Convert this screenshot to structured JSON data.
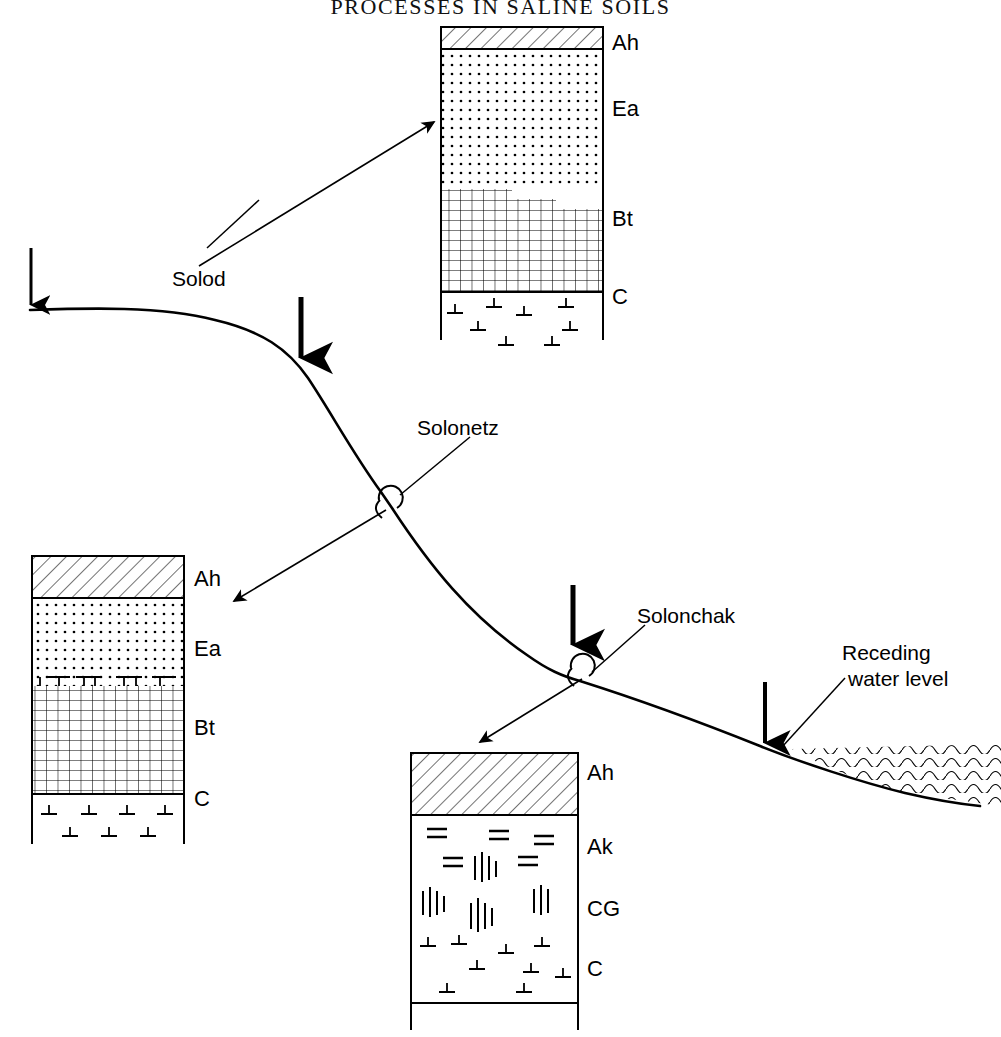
{
  "figure": {
    "title": "PROCESSES IN SALINE SOILS",
    "title_clipped": true,
    "type": "landscape-catena-diagram",
    "background": "#ffffff",
    "ink_color": "#000000"
  },
  "landscape": {
    "labels": [
      {
        "id": "solod",
        "text": "Solod",
        "x": 172,
        "y": 268
      },
      {
        "id": "solonetz",
        "text": "Solonetz",
        "x": 417,
        "y": 417
      },
      {
        "id": "solonchak",
        "text": "Solonchak",
        "x": 637,
        "y": 605
      }
    ],
    "water": {
      "label_line1": "Receding",
      "label_line2": "water level",
      "label_x": 843,
      "label_y": 641
    },
    "arrow_count": 4,
    "arrows": [
      {
        "id": "infiltration-arrow-1",
        "x": 31,
        "y1": 248,
        "y2": 310,
        "width": 3
      },
      {
        "id": "infiltration-arrow-2",
        "x": 301,
        "y1": 297,
        "y2": 363,
        "width": 5
      },
      {
        "id": "infiltration-arrow-3",
        "x": 573,
        "y1": 585,
        "y2": 650,
        "width": 5
      },
      {
        "id": "infiltration-arrow-4",
        "x": 765,
        "y1": 682,
        "y2": 748,
        "width": 4
      }
    ]
  },
  "profiles": [
    {
      "id": "solod-profile",
      "name": "Solod",
      "box": {
        "x": 441,
        "y": 27,
        "w": 162,
        "h": 265
      },
      "horizons": [
        {
          "code": "Ah",
          "pattern": "diagonal-hatch",
          "y": 27,
          "h": 22,
          "label_y": 32
        },
        {
          "code": "Ea",
          "pattern": "dot-stipple",
          "y": 49,
          "h": 140,
          "label_y": 97
        },
        {
          "code": "Bt",
          "pattern": "cross-grid",
          "y": 189,
          "h": 103,
          "label_y": 207
        },
        {
          "code": "C",
          "pattern": "perpendicular-symbols",
          "y": 292,
          "h": 48,
          "label_y": 285
        }
      ]
    },
    {
      "id": "solonetz-profile",
      "name": "Solonetz",
      "box": {
        "x": 32,
        "y": 556,
        "w": 152,
        "h": 238
      },
      "horizons": [
        {
          "code": "Ah",
          "pattern": "diagonal-hatch",
          "y": 556,
          "h": 42,
          "label_y": 567
        },
        {
          "code": "Ea",
          "pattern": "dot-stipple",
          "y": 598,
          "h": 88,
          "label_y": 637
        },
        {
          "code": "Bt",
          "pattern": "cross-grid",
          "y": 686,
          "h": 108,
          "label_y": 716
        },
        {
          "code": "C",
          "pattern": "perpendicular-symbols",
          "y": 794,
          "h": 50,
          "label_y": 787
        }
      ]
    },
    {
      "id": "solonchak-profile",
      "name": "Solonchak",
      "box": {
        "x": 411,
        "y": 753,
        "w": 167,
        "h": 250
      },
      "horizons": [
        {
          "code": "Ah",
          "pattern": "diagonal-hatch",
          "y": 753,
          "h": 62,
          "label_y": 762
        },
        {
          "code": "Ak",
          "pattern": "salt-equals-symbols",
          "y": 815,
          "h": 62,
          "label_y": 836
        },
        {
          "code": "CG",
          "pattern": "gley-vertical-marks",
          "y": 877,
          "h": 62,
          "label_y": 898
        },
        {
          "code": "C",
          "pattern": "perpendicular-symbols",
          "y": 939,
          "h": 64,
          "label_y": 958
        }
      ]
    }
  ],
  "pointer_arrows": [
    {
      "id": "to-solod-profile",
      "x1": 199,
      "y1": 266,
      "x2": 436,
      "y2": 121
    },
    {
      "id": "to-solonetz-profile",
      "x1": 386,
      "y1": 510,
      "x2": 232,
      "y2": 602
    },
    {
      "id": "to-solonchak-profile",
      "x1": 582,
      "y1": 679,
      "x2": 478,
      "y2": 744
    }
  ],
  "leader_lines": [
    {
      "id": "solod-leader",
      "x1": 207,
      "y1": 245,
      "x2": 258,
      "y2": 200
    },
    {
      "id": "solonetz-leader",
      "x1": 412,
      "y1": 487,
      "x2": 412,
      "y2": 430
    },
    {
      "id": "solonchak-leader",
      "x1": 600,
      "y1": 664,
      "x2": 640,
      "y2": 622
    },
    {
      "id": "water-leader",
      "x1": 790,
      "y1": 748,
      "x2": 840,
      "y2": 695
    }
  ]
}
